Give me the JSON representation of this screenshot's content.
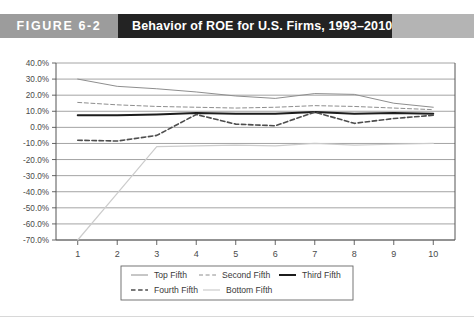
{
  "figure": {
    "number_label": "FIGURE 6-2",
    "title": "Behavior of ROE for U.S. Firms, 1993–2010"
  },
  "colors": {
    "band_number_bg": "#9c9c9c",
    "band_title_bg": "#232323",
    "band_tail_bg": "#b4b4b4",
    "plot_border": "#555555",
    "gridline": "#8d8d8d",
    "top_fifth": "#8e8e8e",
    "second_fifth": "#8e8e8e",
    "third_fifth": "#1c1c1c",
    "fourth_fifth": "#4d4d4d",
    "bottom_fifth": "#cccccc"
  },
  "chart_data": {
    "type": "line",
    "title": "Behavior of ROE for U.S. Firms, 1993–2010",
    "xlabel": "",
    "ylabel": "",
    "x": [
      1,
      2,
      3,
      4,
      5,
      6,
      7,
      8,
      9,
      10
    ],
    "xtick_labels": [
      "1",
      "2",
      "3",
      "4",
      "5",
      "6",
      "7",
      "8",
      "9",
      "10"
    ],
    "ytick_labels": [
      "40.0%",
      "30.0%",
      "20.0%",
      "10.0%",
      "0.0%",
      "-10.0%",
      "-20.0%",
      "-30.0%",
      "-40.0%",
      "-50.0%",
      "-60.0%",
      "-70.0%"
    ],
    "ytick_values": [
      40,
      30,
      20,
      10,
      0,
      -10,
      -20,
      -30,
      -40,
      -50,
      -60,
      -70
    ],
    "ylim": [
      -70,
      40
    ],
    "xlim": [
      0.45,
      10.55
    ],
    "grid": true,
    "legend_position": "bottom",
    "series": [
      {
        "name": "Top Fifth",
        "style": "solid-light",
        "values": [
          30.0,
          25.5,
          24.0,
          22.0,
          19.5,
          18.0,
          21.0,
          20.5,
          15.0,
          12.5
        ]
      },
      {
        "name": "Second Fifth",
        "style": "dashed-light",
        "values": [
          15.5,
          14.0,
          13.0,
          12.5,
          12.0,
          12.5,
          13.5,
          13.0,
          12.0,
          11.0
        ]
      },
      {
        "name": "Third Fifth",
        "style": "solid-bold-dark",
        "values": [
          7.5,
          7.5,
          8.0,
          9.0,
          8.5,
          8.5,
          9.5,
          8.5,
          9.0,
          8.5
        ]
      },
      {
        "name": "Fourth Fifth",
        "style": "dashed-dark",
        "values": [
          -8.0,
          -8.5,
          -5.0,
          8.0,
          2.0,
          1.0,
          9.5,
          2.5,
          5.5,
          7.5
        ]
      },
      {
        "name": "Bottom Fifth",
        "style": "solid-verylight",
        "values": [
          -70.0,
          -41.0,
          -12.0,
          -11.5,
          -11.0,
          -11.5,
          -10.0,
          -11.0,
          -10.5,
          -10.0
        ]
      }
    ]
  },
  "legend": {
    "items": [
      {
        "label": "Top Fifth",
        "style": "solid-light"
      },
      {
        "label": "Second Fifth",
        "style": "dashed-light"
      },
      {
        "label": "Third Fifth",
        "style": "solid-bold-dark"
      },
      {
        "label": "Fourth Fifth",
        "style": "dashed-dark"
      },
      {
        "label": "Bottom Fifth",
        "style": "solid-verylight"
      }
    ]
  }
}
